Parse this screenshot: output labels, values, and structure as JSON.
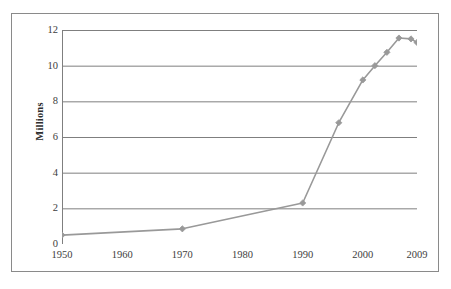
{
  "chart_data": {
    "type": "line",
    "title": "",
    "xlabel": "",
    "ylabel": "Millions",
    "xlim": [
      1950,
      2009
    ],
    "ylim": [
      0,
      12
    ],
    "grid": "horizontal",
    "legend": "none",
    "marker": "diamond",
    "series_color": "#999999",
    "axis_color": "#7f7f7f",
    "xticks": [
      "1950",
      "1960",
      "1970",
      "1980",
      "1990",
      "2000",
      "2009"
    ],
    "xtick_values": [
      1950,
      1960,
      1970,
      1980,
      1990,
      2000,
      2009
    ],
    "yticks": [
      "0",
      "2",
      "4",
      "6",
      "8",
      "10",
      "12"
    ],
    "ytick_values": [
      0,
      2,
      4,
      6,
      8,
      10,
      12
    ],
    "x": [
      1950,
      1970,
      1990,
      1996,
      2000,
      2002,
      2004,
      2006,
      2008,
      2009
    ],
    "values": [
      0.5,
      0.85,
      2.3,
      6.8,
      9.2,
      10.0,
      10.75,
      11.55,
      11.5,
      11.3
    ],
    "points": [
      {
        "x": 1950,
        "y": 0.5
      },
      {
        "x": 1970,
        "y": 0.85
      },
      {
        "x": 1990,
        "y": 2.3
      },
      {
        "x": 1996,
        "y": 6.8
      },
      {
        "x": 2000,
        "y": 9.2
      },
      {
        "x": 2002,
        "y": 10.0
      },
      {
        "x": 2004,
        "y": 10.75
      },
      {
        "x": 2006,
        "y": 11.55
      },
      {
        "x": 2008,
        "y": 11.5
      },
      {
        "x": 2009,
        "y": 11.3
      }
    ]
  }
}
